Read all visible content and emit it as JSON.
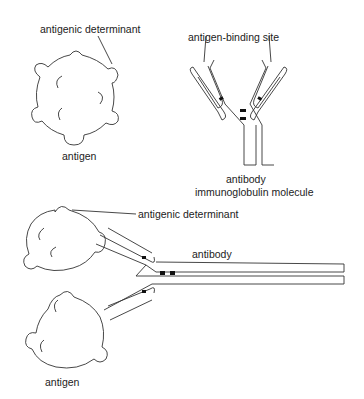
{
  "labels": {
    "top_antigenic_determinant": "antigenic determinant",
    "top_antigen": "antigen",
    "antigen_binding_site": "antigen-binding site",
    "antibody": "antibody",
    "immunoglobulin_molecule": "immunoglobulin molecule",
    "bottom_antigenic_determinant": "antigenic determinant",
    "bottom_antibody": "antibody",
    "bottom_antigen": "antigen"
  },
  "colors": {
    "stroke": "#333333",
    "background": "#ffffff",
    "disulfide_bond": "#111111"
  }
}
